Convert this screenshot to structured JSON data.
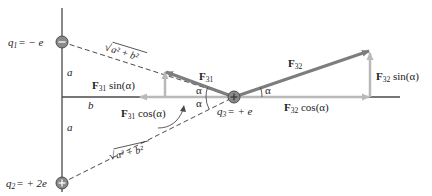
{
  "charges": {
    "q1": {
      "name": "q",
      "sub": "1",
      "value": "= − e",
      "sign": "−"
    },
    "q2": {
      "name": "q",
      "sub": "2",
      "value": "= + 2e",
      "sign": "+"
    },
    "q3": {
      "name": "q",
      "sub": "3",
      "value": "= + e",
      "sign": "+"
    }
  },
  "distances": {
    "a_upper": "a",
    "a_lower": "a",
    "b": "b",
    "hyp_upper": "a² + b²",
    "hyp_lower": "a² + b²",
    "sqrt": "√"
  },
  "forces": {
    "f31": {
      "F": "F",
      "sub": "31"
    },
    "f32": {
      "F": "F",
      "sub": "32"
    },
    "f31_sin": {
      "F": "F",
      "sub": "31",
      "fn": " sin(α)"
    },
    "f31_cos": {
      "F": "F",
      "sub": "31",
      "fn": " cos(α)"
    },
    "f32_sin": {
      "F": "F",
      "sub": "32",
      "fn": " sin(α)"
    },
    "f32_cos": {
      "F": "F",
      "sub": "32",
      "fn": " cos(α)"
    }
  },
  "angles": {
    "alpha": "α"
  },
  "colors": {
    "axis": "#4a4a4a",
    "force": "#7d7d7d",
    "component": "#b9b9b9",
    "charge_fill": "#8a8a8a"
  }
}
